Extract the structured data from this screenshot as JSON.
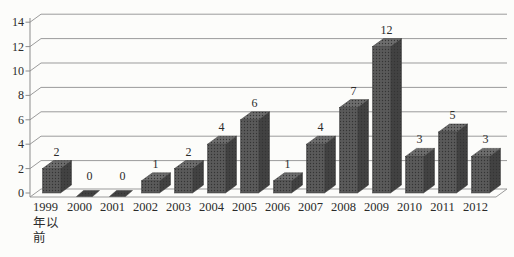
{
  "chart_data": {
    "type": "bar",
    "variant": "3d-column",
    "title": "",
    "categories": [
      "1999年以前",
      "2000",
      "2001",
      "2002",
      "2003",
      "2004",
      "2005",
      "2006",
      "2007",
      "2008",
      "2009",
      "2010",
      "2011",
      "2012"
    ],
    "first_category_wrapped_lines": [
      "1999",
      "年以",
      "前"
    ],
    "values": [
      2,
      0,
      0,
      1,
      2,
      4,
      6,
      1,
      4,
      7,
      12,
      3,
      5,
      3
    ],
    "value_labels_shown": true,
    "yticks": [
      0,
      2,
      4,
      6,
      8,
      10,
      12,
      14
    ],
    "ylim": [
      0,
      14
    ],
    "grid": true,
    "legend": "none",
    "colors": {
      "bar_front": "#5a5a5a",
      "bar_side": "#424242",
      "bar_top": "#6d6d6d",
      "bar_dot": "#343434",
      "bar_edge": "#3a3a3a",
      "gridline": "#9b9b9b",
      "axis": "#8c8c8c",
      "text": "#2b2b2b",
      "background": "#fcfcfa"
    }
  }
}
